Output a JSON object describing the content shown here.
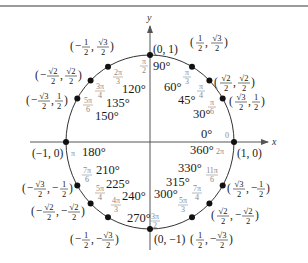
{
  "diagram": {
    "axes": {
      "x_label": "x",
      "y_label": "y"
    },
    "colors": {
      "line": "#333333",
      "point": "#111111",
      "radian_text": "#8a8a8a",
      "degree_text": "#1a1a1a",
      "border": "#9a9a9a"
    },
    "points": [
      {
        "deg": "0°",
        "deg2": "360°",
        "rad": [
          "0"
        ],
        "rad2": [
          "2π"
        ],
        "coord": "(1, 0)"
      },
      {
        "deg": "30°",
        "rad": [
          "π",
          "6"
        ],
        "x": [
          "√3",
          "2"
        ],
        "y": [
          "1",
          "2"
        ]
      },
      {
        "deg": "45°",
        "rad": [
          "π",
          "4"
        ],
        "x": [
          "√2",
          "2"
        ],
        "y": [
          "√2",
          "2"
        ]
      },
      {
        "deg": "60°",
        "rad": [
          "π",
          "3"
        ],
        "x": [
          "1",
          "2"
        ],
        "y": [
          "√3",
          "2"
        ]
      },
      {
        "deg": "90°",
        "rad": [
          "π",
          "2"
        ],
        "coord": "(0, 1)"
      },
      {
        "deg": "120°",
        "rad": [
          "2π",
          "3"
        ],
        "x": [
          "−1",
          "2"
        ],
        "y": [
          "√3",
          "2"
        ]
      },
      {
        "deg": "135°",
        "rad": [
          "3π",
          "4"
        ],
        "x": [
          "−√2",
          "2"
        ],
        "y": [
          "√2",
          "2"
        ]
      },
      {
        "deg": "150°",
        "rad": [
          "5π",
          "6"
        ],
        "x": [
          "−√3",
          "2"
        ],
        "y": [
          "1",
          "2"
        ]
      },
      {
        "deg": "180°",
        "rad": [
          "π"
        ],
        "coord": "(−1, 0)"
      },
      {
        "deg": "210°",
        "rad": [
          "7π",
          "6"
        ],
        "x": [
          "−√3",
          "2"
        ],
        "y": [
          "−1",
          "2"
        ]
      },
      {
        "deg": "225°",
        "rad": [
          "5π",
          "4"
        ],
        "x": [
          "−√2",
          "2"
        ],
        "y": [
          "−√2",
          "2"
        ]
      },
      {
        "deg": "240°",
        "rad": [
          "4π",
          "3"
        ],
        "x": [
          "−1",
          "2"
        ],
        "y": [
          "−√3",
          "2"
        ]
      },
      {
        "deg": "270°",
        "rad": [
          "3π",
          "2"
        ],
        "coord": "(0, −1)"
      },
      {
        "deg": "300°",
        "rad": [
          "5π",
          "3"
        ],
        "x": [
          "1",
          "2"
        ],
        "y": [
          "−√3",
          "2"
        ]
      },
      {
        "deg": "315°",
        "rad": [
          "7π",
          "4"
        ],
        "x": [
          "√2",
          "2"
        ],
        "y": [
          "−√2",
          "2"
        ]
      },
      {
        "deg": "330°",
        "rad": [
          "11π",
          "6"
        ],
        "x": [
          "√3",
          "2"
        ],
        "y": [
          "−1",
          "2"
        ]
      }
    ],
    "labels": {
      "deg_0": "0°",
      "deg_360": "360°",
      "rad_0": "0",
      "rad_2pi": "2π",
      "coord_1_0": "(1, 0)",
      "deg_30": "30°",
      "deg_45": "45°",
      "deg_60": "60°",
      "deg_90": "90°",
      "coord_0_1": "(0, 1)",
      "deg_120": "120°",
      "deg_135": "135°",
      "deg_150": "150°",
      "deg_180": "180°",
      "rad_pi": "π",
      "coord_m1_0": "(−1, 0)",
      "deg_210": "210°",
      "deg_225": "225°",
      "deg_240": "240°",
      "deg_270": "270°",
      "coord_0_m1": "(0, −1)",
      "deg_300": "300°",
      "deg_315": "315°",
      "deg_330": "330°",
      "pi": "π",
      "two_pi": "2π",
      "three_pi": "3π",
      "four_pi": "4π",
      "five_pi": "5π",
      "seven_pi": "7π",
      "eleven_pi": "11π",
      "d2": "2",
      "d3": "3",
      "d4": "4",
      "d6": "6",
      "one": "1",
      "sqrt2": "√2",
      "sqrt3": "√3",
      "minus": "−",
      "comma": ",",
      "lp": "(",
      "rp": ")"
    }
  }
}
